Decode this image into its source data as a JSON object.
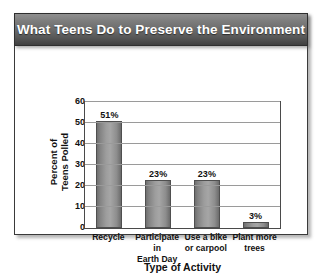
{
  "card": {
    "title": "What Teens Do to Preserve the Environment"
  },
  "chart_data": {
    "type": "bar",
    "title": "What Teens Do to Preserve the Environment",
    "xlabel": "Type of Activity",
    "ylabel": "Percent of Teens Polled",
    "ylabel_lines": [
      "Percent of",
      "Teens Polled"
    ],
    "categories": [
      "Recycle",
      "Participate in Earth Day",
      "Use a bike or carpool",
      "Plant more trees"
    ],
    "category_lines": [
      [
        "Recycle"
      ],
      [
        "Participate in",
        "Earth Day"
      ],
      [
        "Use a bike",
        "or carpool"
      ],
      [
        "Plant more",
        "trees"
      ]
    ],
    "values": [
      51,
      23,
      23,
      3
    ],
    "data_labels": [
      "51%",
      "23%",
      "23%",
      "3%"
    ],
    "ylim": [
      0,
      60
    ],
    "yticks": [
      0,
      10,
      20,
      30,
      40,
      50,
      60
    ],
    "ytick_labels": [
      "0",
      "10",
      "20",
      "30",
      "40",
      "50",
      "60"
    ],
    "grid": "horizontal",
    "legend": "none",
    "bar_color": "#9d9d9d",
    "bar_border_color": "#4f4f4f",
    "axis_color": "#4a4a4a",
    "gridline_color": "#9a9a9a",
    "title_bar_color": "#6a6a6a",
    "title_text_color": "#ffffff"
  }
}
